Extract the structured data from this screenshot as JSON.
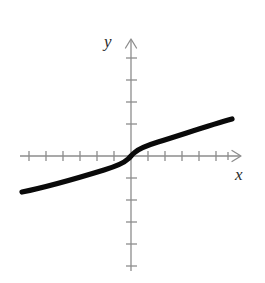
{
  "figure": {
    "background_color": "#ffffff",
    "width": 265,
    "height": 283,
    "axis_color": "#8d8d8d",
    "curve_color": "#0a0a0a"
  },
  "labels": {
    "x_axis": "x",
    "y_axis": "y"
  },
  "chart_data": {
    "type": "line",
    "title": "",
    "subtitle": "",
    "xlabel": "x",
    "ylabel": "y",
    "function": "y = x^(1/3)",
    "grid": false,
    "legend": null,
    "origin_px": {
      "x": 131,
      "y": 156
    },
    "tick_spacing_px": {
      "x": 17,
      "y": 22
    },
    "axis_ranges": {
      "xlim": [
        -6.5,
        6.4
      ],
      "ylim": [
        -5.2,
        5.4
      ]
    },
    "x_tick_values": [
      -6,
      -5,
      -4,
      -3,
      -2,
      -1,
      1,
      2,
      3,
      4,
      5,
      6
    ],
    "y_tick_values": [
      -5,
      -4,
      -3,
      -2,
      -1,
      1,
      2,
      3,
      4,
      5
    ],
    "x": [
      -6.4,
      -5.6,
      -4.8,
      -4.0,
      -3.2,
      -2.4,
      -1.6,
      -1.0,
      -0.6,
      -0.3,
      -0.12,
      -0.04,
      0,
      0.04,
      0.12,
      0.3,
      0.6,
      1.0,
      1.6,
      2.4,
      3.2,
      4.0,
      4.8,
      5.6,
      5.95
    ],
    "values": [
      -1.86,
      -1.78,
      -1.69,
      -1.59,
      -1.47,
      -1.34,
      -1.17,
      -1.0,
      -0.84,
      -0.67,
      -0.49,
      -0.34,
      0,
      0.34,
      0.49,
      0.67,
      0.84,
      1.0,
      1.17,
      1.34,
      1.47,
      1.59,
      1.69,
      1.78,
      1.81
    ],
    "series": [
      {
        "name": "y = cube root of x",
        "values": [
          -1.86,
          -1.78,
          -1.69,
          -1.59,
          -1.47,
          -1.34,
          -1.17,
          -1.0,
          -0.84,
          -0.67,
          -0.49,
          -0.34,
          0,
          0.34,
          0.49,
          0.67,
          0.84,
          1.0,
          1.17,
          1.34,
          1.47,
          1.59,
          1.69,
          1.78,
          1.81
        ],
        "color": "#0a0a0a",
        "line_width": 5.2
      }
    ],
    "annotations": []
  }
}
